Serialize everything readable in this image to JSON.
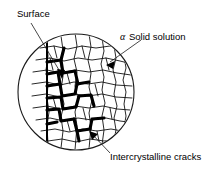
{
  "figure": {
    "background_color": "#ffffff",
    "ink_color": "#000000",
    "labels": {
      "surface": "Surface",
      "alpha_symbol": "α",
      "alpha_solid_solution": "Solid solution",
      "intercrystalline_cracks": "Intercrystalline cracks"
    },
    "geometry": {
      "circle_center_x": 76,
      "circle_center_y": 92,
      "circle_radius": 58,
      "surface_line_x": 47,
      "surface_line_top_y": 42,
      "surface_line_bottom_y": 144
    }
  }
}
